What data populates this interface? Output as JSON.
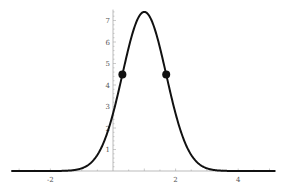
{
  "chart_data": {
    "type": "line",
    "title": "",
    "xlabel": "",
    "ylabel": "",
    "xlim": [
      -3,
      5
    ],
    "ylim": [
      0,
      7.6
    ],
    "grid": false,
    "legend": null,
    "series": [
      {
        "name": "curve",
        "function": "7.4*exp(-(x-1)^2/(2*0.7^2))",
        "peak": {
          "x": 1,
          "y": 7.4
        },
        "sigma": 0.7,
        "color": "#111111"
      }
    ],
    "points": [
      {
        "x": 0.3,
        "y": 4.49,
        "label": "inflection point"
      },
      {
        "x": 1.7,
        "y": 4.49,
        "label": "inflection point"
      }
    ],
    "x_ticks": [
      -2,
      2,
      4
    ],
    "y_ticks": [
      1,
      2,
      3,
      4,
      5,
      6,
      7
    ]
  },
  "axes": {
    "x_tick_labels": [
      "-2",
      "2",
      "4"
    ],
    "y_tick_labels": [
      "1",
      "2",
      "3",
      "4",
      "5",
      "6",
      "7"
    ]
  }
}
